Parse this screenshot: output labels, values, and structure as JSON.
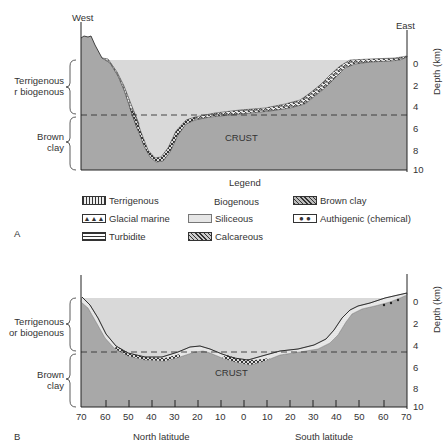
{
  "panel_a": {
    "label": "A",
    "west_label": "West",
    "east_label": "East",
    "left_labels": {
      "upper": "Terrigenous\nor biogenous",
      "upper_visible": [
        "Terrigenous",
        "r biogenous"
      ],
      "lower": [
        "Brown",
        "clay"
      ]
    },
    "crust_label": "CRUST",
    "depth_axis": {
      "label": "Depth (km)",
      "ticks": [
        "0",
        "2",
        "4",
        "6",
        "8",
        "10"
      ]
    }
  },
  "legend": {
    "title": "Legend",
    "biogenous_header": "Biogenous",
    "items": [
      {
        "name": "Terrigenous",
        "pattern": "vertical-grid"
      },
      {
        "name": "Glacial marine",
        "pattern": "triangles"
      },
      {
        "name": "Turbidite",
        "pattern": "horizontal-lines"
      },
      {
        "name": "Siliceous",
        "pattern": "stipple"
      },
      {
        "name": "Calcareous",
        "pattern": "brick"
      },
      {
        "name": "Brown clay",
        "pattern": "crosshatch"
      },
      {
        "name": "Authigenic (chemical)",
        "pattern": "ovals"
      }
    ]
  },
  "panel_b": {
    "label": "B",
    "left_labels": {
      "upper": [
        "Terrigenous",
        "or biogenous"
      ],
      "lower": [
        "Brown",
        "clay"
      ]
    },
    "crust_label": "CRUST",
    "depth_axis": {
      "label": "Depth (km)",
      "ticks": [
        "0",
        "2",
        "4",
        "6",
        "8",
        "10"
      ]
    },
    "x_ticks": [
      "70",
      "60",
      "50",
      "40",
      "30",
      "20",
      "10",
      "0",
      "10",
      "20",
      "30",
      "40",
      "50",
      "60",
      "70"
    ],
    "x_label_north": "North latitude",
    "x_label_south": "South latitude"
  },
  "colors": {
    "ocean": "#d9d9d9",
    "crust": "#a8a8a8",
    "line": "#222222"
  }
}
